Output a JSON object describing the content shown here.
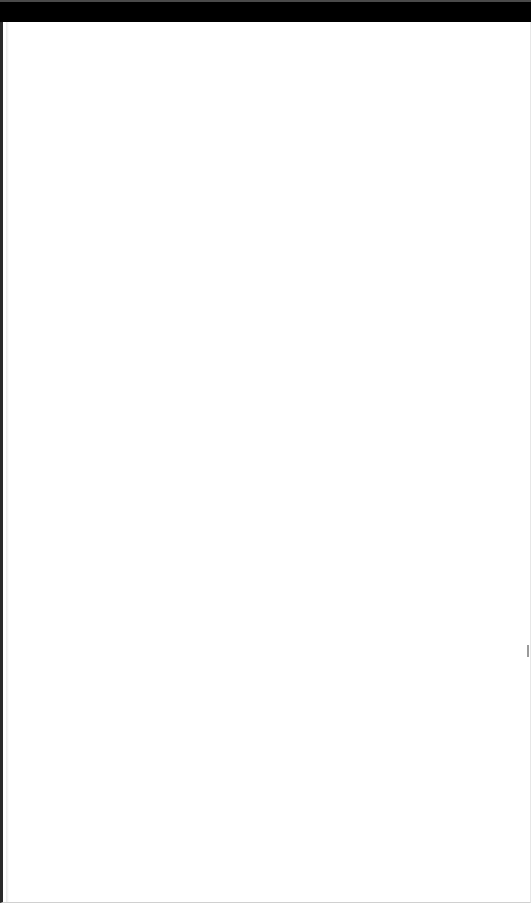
{
  "window": {
    "title": "",
    "colors": {
      "title_bar": "#000000",
      "top_edge": "#4a4a4a",
      "background": "#ffffff",
      "left_border": "#2a2a2a"
    }
  },
  "content": {
    "text": ""
  }
}
